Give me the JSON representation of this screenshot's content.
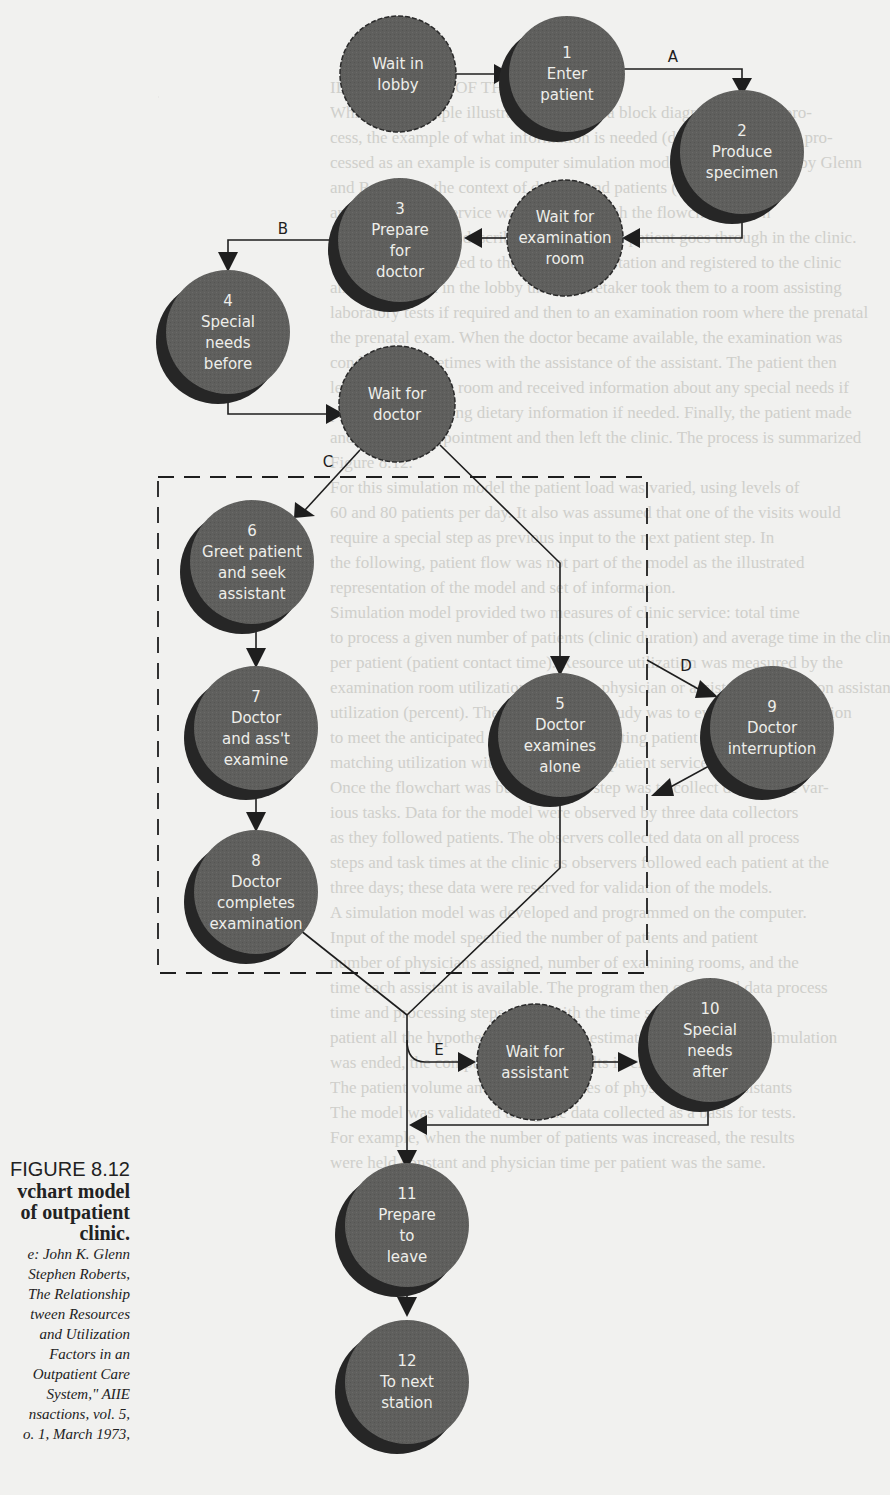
{
  "background_text": [
    "",
    "",
    "",
    "ILLUSTRATION OF THE METHOD",
    "While this example illustrates the use of a block diagram (termed) pro-",
    "cess, the example of what information is needed (data), collected and pro-",
    "cessed as an example is computer simulation model. A study studied by Glenn",
    "and Roberts in the context of doctors and patients (doctors, offices,",
    "and) one patient service was simulated with the flowchart shown",
    "Figure 8.12, which describes the steps each patient goes through in the clinic.",
    "Each patient reported to the appointment station and registered to the clinic",
    "and then waited in the lobby until a caretaker took them to a room assisting",
    "laboratory tests if required and then to an examination room where the prenatal",
    "the prenatal exam. When the doctor became available, the examination was",
    "conducted, sometimes with the assistance of the assistant. The patient then",
    "left the examining room and received information about any special needs if",
    "pregnancy, including dietary information if needed. Finally, the patient made",
    "another clinic appointment and then left the clinic. The process is summarized",
    "Figure 8.12.",
    "For this simulation model the patient load was varied, using levels of",
    "60 and 80 patients per day. It also was assumed that one of the visits would",
    "require a special step as previous input to the next patient step. In",
    "the following, patient flow was not part of the model as the illustrated",
    "representation of the model and set of information.",
    "Simulation model provided two measures of clinic service: total time",
    "to process a given number of patients (clinic duration) and average time in the clinic",
    "per patient (patient contact time). Resource utilization was measured by the",
    "examination room utilization (percent), physician or assistant (percent) on assistant",
    "utilization (percent). The purpose of the study was to evaluate the simulation",
    "to meet the anticipated resource while meeting patient needs and assistant",
    "matching utilization with the measure of patient service.",
    "Once the flowchart was built, the next step was to collect data on the var-",
    "ious tasks. Data for the model were observed by three data collectors",
    "as they followed patients. The observers collected data on all process",
    "steps and task times at the clinic as observers followed each patient at the",
    "three days; these data were reserved for validation of the models.",
    "A simulation model was developed and programmed on the computer.",
    "Input of the model specified the number of patients and patient",
    "number of physicians assigned, number of examining rooms, and the",
    "time each assistant is available. The program then compared data process",
    "time and processing steps along with the time steps for each",
    "patient all the hypothetical patients to estimate times. When the simulation",
    "was ended, the computer reported results in clinic performance.",
    "The patient volume and utilization rates of physicians and assistants",
    "The model was validated using the data collected as a basis for tests.",
    "For example, when the number of patients was increased, the results",
    "were held constant and physician time per patient was the same."
  ],
  "diagram": {
    "nodes": [
      {
        "id": "wait-lobby",
        "number": "",
        "lines": [
          "Wait in",
          "lobby"
        ],
        "type": "wait"
      },
      {
        "id": "n1",
        "number": "1",
        "lines": [
          "Enter",
          "patient"
        ],
        "type": "activity"
      },
      {
        "id": "n2",
        "number": "2",
        "lines": [
          "Produce",
          "specimen"
        ],
        "type": "activity"
      },
      {
        "id": "wait-exam-room",
        "number": "",
        "lines": [
          "Wait for",
          "examination",
          "room"
        ],
        "type": "wait"
      },
      {
        "id": "n3",
        "number": "3",
        "lines": [
          "Prepare",
          "for",
          "doctor"
        ],
        "type": "activity"
      },
      {
        "id": "n4",
        "number": "4",
        "lines": [
          "Special",
          "needs",
          "before"
        ],
        "type": "activity"
      },
      {
        "id": "wait-doctor",
        "number": "",
        "lines": [
          "Wait for",
          "doctor"
        ],
        "type": "wait"
      },
      {
        "id": "n6",
        "number": "6",
        "lines": [
          "Greet patient",
          "and seek",
          "assistant"
        ],
        "type": "activity"
      },
      {
        "id": "n5",
        "number": "5",
        "lines": [
          "Doctor",
          "examines",
          "alone"
        ],
        "type": "activity"
      },
      {
        "id": "n9",
        "number": "9",
        "lines": [
          "Doctor",
          "interruption"
        ],
        "type": "activity"
      },
      {
        "id": "n7",
        "number": "7",
        "lines": [
          "Doctor",
          "and ass't",
          "examine"
        ],
        "type": "activity"
      },
      {
        "id": "n8",
        "number": "8",
        "lines": [
          "Doctor",
          "completes",
          "examination"
        ],
        "type": "activity"
      },
      {
        "id": "wait-assistant",
        "number": "",
        "lines": [
          "Wait for",
          "assistant"
        ],
        "type": "wait"
      },
      {
        "id": "n10",
        "number": "10",
        "lines": [
          "Special",
          "needs",
          "after"
        ],
        "type": "activity"
      },
      {
        "id": "n11",
        "number": "11",
        "lines": [
          "Prepare",
          "to",
          "leave"
        ],
        "type": "activity"
      },
      {
        "id": "n12",
        "number": "12",
        "lines": [
          "To next",
          "station"
        ],
        "type": "activity"
      }
    ],
    "edge_labels": {
      "A": "A",
      "B": "B",
      "C": "C",
      "D": "D",
      "E": "E"
    },
    "colors": {
      "node_fill": "#5f5f5d",
      "node_shadow": "#262626",
      "node_text": "#eeeeea",
      "line": "#1e1e1e",
      "page": "#f1f1ef"
    }
  },
  "caption": {
    "figure": "FIGURE 8.12",
    "title_lines": [
      "vchart model",
      "of outpatient",
      "clinic."
    ],
    "source_lines": [
      "e: John K. Glenn",
      "Stephen Roberts,",
      "The Relationship",
      "tween Resources",
      "and Utilization",
      "Factors in an",
      "Outpatient Care",
      "System,\" AIIE",
      "nsactions, vol. 5,",
      "o. 1, March 1973,"
    ]
  }
}
